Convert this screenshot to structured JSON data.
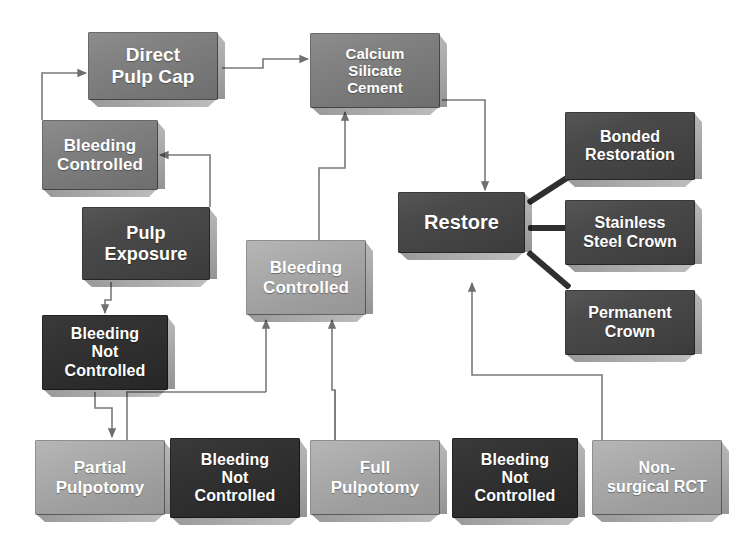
{
  "diagram": {
    "background": "#ffffff",
    "palette": {
      "dark": "#4a4a4a",
      "darkest": "#2b2b2b",
      "mid": "#7e7e7e",
      "light": "#a8a8a8",
      "connector": "#7a7a7a",
      "thick_connector": "#2f2f2f",
      "text": "#ffffff"
    },
    "nodes": [
      {
        "id": "direct-pulp-cap",
        "label": "Direct\nPulp Cap",
        "tone": "mid",
        "x": 88,
        "y": 32,
        "w": 130,
        "h": 68,
        "font": 19
      },
      {
        "id": "calcium-silicate",
        "label": "Calcium\nSilicate\nCement",
        "tone": "mid",
        "x": 310,
        "y": 33,
        "w": 130,
        "h": 75,
        "font": 15
      },
      {
        "id": "bleeding-controlled-1",
        "label": "Bleeding\nControlled",
        "tone": "mid",
        "x": 42,
        "y": 120,
        "w": 116,
        "h": 70,
        "font": 17
      },
      {
        "id": "pulp-exposure",
        "label": "Pulp\nExposure",
        "tone": "dark",
        "x": 82,
        "y": 207,
        "w": 128,
        "h": 73,
        "font": 18
      },
      {
        "id": "bleeding-controlled-2",
        "label": "Bleeding\nControlled",
        "tone": "light",
        "x": 246,
        "y": 240,
        "w": 120,
        "h": 75,
        "font": 17
      },
      {
        "id": "bleeding-not-ctrl-1",
        "label": "Bleeding\nNot\nControlled",
        "tone": "darkest",
        "x": 42,
        "y": 315,
        "w": 126,
        "h": 75,
        "font": 16
      },
      {
        "id": "restore",
        "label": "Restore",
        "tone": "dark",
        "x": 398,
        "y": 192,
        "w": 127,
        "h": 61,
        "font": 20
      },
      {
        "id": "bonded-restoration",
        "label": "Bonded\nRestoration",
        "tone": "dark",
        "x": 565,
        "y": 112,
        "w": 130,
        "h": 68,
        "font": 16
      },
      {
        "id": "stainless-steel-crown",
        "label": "Stainless\nSteel Crown",
        "tone": "dark",
        "x": 565,
        "y": 200,
        "w": 130,
        "h": 65,
        "font": 16
      },
      {
        "id": "permanent-crown",
        "label": "Permanent\nCrown",
        "tone": "dark",
        "x": 565,
        "y": 290,
        "w": 130,
        "h": 65,
        "font": 16
      },
      {
        "id": "partial-pulpotomy",
        "label": "Partial\nPulpotomy",
        "tone": "light",
        "x": 35,
        "y": 440,
        "w": 130,
        "h": 75,
        "font": 17
      },
      {
        "id": "bleeding-not-ctrl-2",
        "label": "Bleeding\nNot\nControlled",
        "tone": "darkest",
        "x": 170,
        "y": 438,
        "w": 130,
        "h": 80,
        "font": 16
      },
      {
        "id": "full-pulpotomy",
        "label": "Full\nPulpotomy",
        "tone": "light",
        "x": 310,
        "y": 440,
        "w": 130,
        "h": 75,
        "font": 17
      },
      {
        "id": "bleeding-not-ctrl-3",
        "label": "Bleeding\nNot\nControlled",
        "tone": "darkest",
        "x": 452,
        "y": 438,
        "w": 126,
        "h": 80,
        "font": 16
      },
      {
        "id": "non-surgical-rct",
        "label": "Non-\nsurgical RCT",
        "tone": "light",
        "x": 592,
        "y": 440,
        "w": 130,
        "h": 75,
        "font": 16
      }
    ],
    "edges": [
      {
        "id": "edge-bleeding1-to-direct-pulp-cap",
        "from": "bleeding-controlled-1",
        "to": "direct-pulp-cap",
        "points": "42,120 42,73 86,73",
        "arrow": true
      },
      {
        "id": "edge-direct-pulp-cap-to-csc",
        "from": "direct-pulp-cap",
        "to": "calcium-silicate",
        "points": "222,68 263,68 263,59 308,59",
        "arrow": true
      },
      {
        "id": "edge-pulp-exposure-to-bleeding1",
        "from": "pulp-exposure",
        "to": "bleeding-controlled-1",
        "points": "210,207 210,155 160,155",
        "arrow": true
      },
      {
        "id": "edge-pulp-exposure-to-bnc1",
        "from": "pulp-exposure",
        "to": "bleeding-not-ctrl-1",
        "points": "111,282 111,300 105,300 105,313",
        "arrow": true
      },
      {
        "id": "edge-bleeding2-to-csc",
        "from": "bleeding-controlled-2",
        "to": "calcium-silicate",
        "points": "319,240 319,168 345,168 345,112",
        "arrow": true
      },
      {
        "id": "edge-csc-to-restore",
        "from": "calcium-silicate",
        "to": "restore",
        "points": "442,100 485,100 485,190",
        "arrow": true
      },
      {
        "id": "edge-bnc1-to-partial",
        "from": "bleeding-not-ctrl-1",
        "to": "partial-pulpotomy",
        "points": "95,392 95,408 112,408 112,437",
        "arrow": true
      },
      {
        "id": "edge-bnc1-right-down",
        "from": "bleeding-not-ctrl-1",
        "to": "bleeding-controlled-2",
        "points": "266,392 266,320",
        "arrow": true
      },
      {
        "id": "edge-partial-to-trunk",
        "from": "partial-pulpotomy",
        "to": "bleeding-controlled-2",
        "points": "127,440 127,392 266,392",
        "arrow": false
      },
      {
        "id": "edge-full-to-bleeding2",
        "from": "full-pulpotomy",
        "to": "bleeding-controlled-2",
        "points": "335,440 335,390 332,390 332,320",
        "arrow": true
      },
      {
        "id": "edge-full-trunk-left",
        "from": "full-pulpotomy",
        "to": "bleeding-controlled-2",
        "points": "335,440 335,390",
        "arrow": false
      },
      {
        "id": "edge-rct-to-restore",
        "from": "non-surgical-rct",
        "to": "restore",
        "points": "602,440 602,375 472,375 472,283",
        "arrow": true
      }
    ],
    "thick_links": [
      {
        "id": "link-restore-bonded",
        "from": "restore",
        "to": "bonded-restoration",
        "x1": 528,
        "y1": 203,
        "x2": 570,
        "y2": 176
      },
      {
        "id": "link-restore-stainless",
        "from": "restore",
        "to": "stainless-steel-crown",
        "x1": 528,
        "y1": 228,
        "x2": 570,
        "y2": 228
      },
      {
        "id": "link-restore-permanent",
        "from": "restore",
        "to": "permanent-crown",
        "x1": 528,
        "y1": 252,
        "x2": 570,
        "y2": 288
      }
    ]
  }
}
